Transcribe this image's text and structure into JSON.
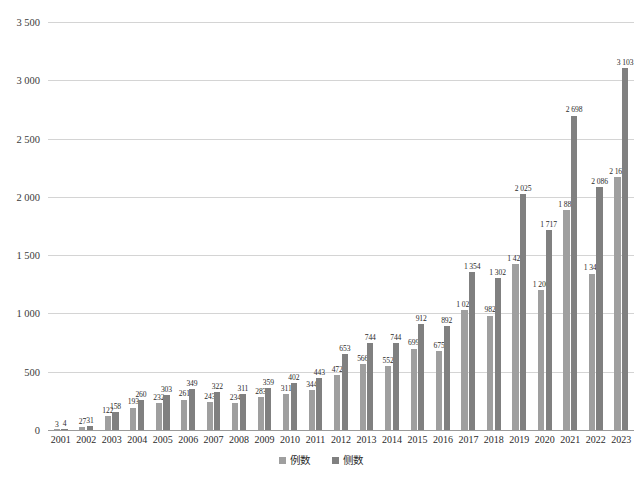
{
  "chart_data": {
    "type": "bar",
    "title": "",
    "subtitle": "",
    "xlabel": "",
    "ylabel": "",
    "grid": true,
    "legend_position": "bottom",
    "ylim": [
      0,
      3500
    ],
    "yticks": [
      0,
      500,
      1000,
      1500,
      2000,
      2500,
      3000,
      3500
    ],
    "ytick_labels": [
      "0",
      "500",
      "1 000",
      "1 500",
      "2 000",
      "2 500",
      "3 000",
      "3 500"
    ],
    "categories": [
      "2001",
      "2002",
      "2003",
      "2004",
      "2005",
      "2006",
      "2007",
      "2008",
      "2009",
      "2010",
      "2011",
      "2012",
      "2013",
      "2014",
      "2015",
      "2016",
      "2017",
      "2018",
      "2019",
      "2020",
      "2021",
      "2022",
      "2023"
    ],
    "series": [
      {
        "name": "例数",
        "color": "#9f9f9f",
        "values": [
          3,
          27,
          122,
          193,
          232,
          261,
          243,
          234,
          283,
          311,
          344,
          472,
          566,
          552,
          699,
          675,
          1029,
          982,
          1421,
          1200,
          1889,
          1342,
          2168
        ],
        "labels": [
          "3",
          "27",
          "122",
          "193",
          "232",
          "261",
          "243",
          "234",
          "283",
          "311",
          "344",
          "472",
          "566",
          "552",
          "699",
          "675",
          "1 029",
          "982",
          "1 421",
          "1 200",
          "1 889",
          "1 342",
          "2 168"
        ]
      },
      {
        "name": "侧数",
        "color": "#808080",
        "values": [
          4,
          31,
          158,
          260,
          303,
          349,
          322,
          311,
          359,
          402,
          443,
          653,
          744,
          744,
          912,
          892,
          1354,
          1302,
          2025,
          1717,
          2698,
          2086,
          3103
        ],
        "labels": [
          "4",
          "31",
          "158",
          "260",
          "303",
          "349",
          "322",
          "311",
          "359",
          "402",
          "443",
          "653",
          "744",
          "744",
          "912",
          "892",
          "1 354",
          "1 302",
          "2 025",
          "1 717",
          "2 698",
          "2 086",
          "3 103"
        ]
      }
    ]
  }
}
